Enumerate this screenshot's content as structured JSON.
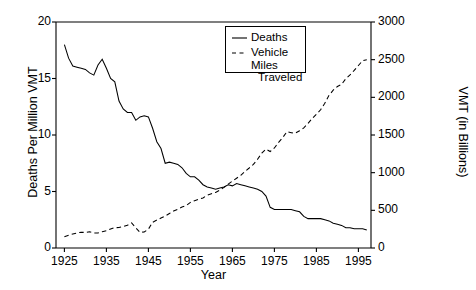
{
  "chart_data": {
    "type": "line",
    "title": "",
    "xlabel": "Year",
    "ylabel": "Deaths Per Million VMT",
    "ylabel_right": "VMT (in Billions)",
    "xlim": [
      1923,
      1998
    ],
    "ylim": [
      0,
      20
    ],
    "ylim_right": [
      0,
      3000
    ],
    "grid": false,
    "legend_position": "top-center",
    "xticks": [
      1925,
      1935,
      1945,
      1955,
      1965,
      1975,
      1985,
      1995
    ],
    "xtick_labels": [
      "1925",
      "1935",
      "1945",
      "1955",
      "1965",
      "1975",
      "1985",
      "1995"
    ],
    "yticks_left": [
      0,
      5,
      10,
      15,
      20
    ],
    "ytick_labels_left": [
      "0",
      "5",
      "10",
      "15",
      "20"
    ],
    "yticks_right": [
      0,
      500,
      1000,
      1500,
      2000,
      2500,
      3000
    ],
    "ytick_labels_right": [
      "0",
      "500",
      "1000",
      "1500",
      "2000",
      "2500",
      "3000"
    ],
    "x": [
      1925,
      1926,
      1927,
      1928,
      1929,
      1930,
      1931,
      1932,
      1933,
      1934,
      1935,
      1936,
      1937,
      1938,
      1939,
      1940,
      1941,
      1942,
      1943,
      1944,
      1945,
      1946,
      1947,
      1948,
      1949,
      1950,
      1951,
      1952,
      1953,
      1954,
      1955,
      1956,
      1957,
      1958,
      1959,
      1960,
      1961,
      1962,
      1963,
      1964,
      1965,
      1966,
      1967,
      1968,
      1969,
      1970,
      1971,
      1972,
      1973,
      1974,
      1975,
      1976,
      1977,
      1978,
      1979,
      1980,
      1981,
      1982,
      1983,
      1984,
      1985,
      1986,
      1987,
      1988,
      1989,
      1990,
      1991,
      1992,
      1993,
      1994,
      1995,
      1996,
      1997
    ],
    "series": [
      {
        "name": "Deaths",
        "axis": "left",
        "style": "solid",
        "units": "deaths per million VMT",
        "values": [
          18.0,
          16.8,
          16.1,
          16.0,
          15.9,
          15.8,
          15.5,
          15.3,
          16.2,
          16.7,
          15.9,
          15.0,
          14.7,
          13.0,
          12.3,
          12.0,
          12.0,
          11.3,
          11.6,
          11.7,
          11.6,
          10.6,
          9.4,
          8.8,
          7.5,
          7.6,
          7.5,
          7.4,
          7.1,
          6.6,
          6.3,
          6.3,
          6.0,
          5.6,
          5.4,
          5.3,
          5.2,
          5.3,
          5.4,
          5.6,
          5.5,
          5.7,
          5.6,
          5.5,
          5.4,
          5.3,
          5.2,
          5.0,
          4.6,
          3.6,
          3.4,
          3.4,
          3.4,
          3.4,
          3.4,
          3.3,
          3.2,
          2.8,
          2.6,
          2.6,
          2.6,
          2.6,
          2.5,
          2.4,
          2.2,
          2.1,
          2.0,
          1.8,
          1.8,
          1.7,
          1.7,
          1.7,
          1.6
        ]
      },
      {
        "name": "Vehicle Miles Traveled",
        "axis": "right",
        "style": "dashed",
        "units": "billions of vehicle miles",
        "values": [
          150,
          170,
          185,
          198,
          210,
          206,
          216,
          200,
          201,
          216,
          229,
          252,
          270,
          271,
          285,
          302,
          334,
          268,
          208,
          213,
          250,
          341,
          371,
          398,
          424,
          458,
          491,
          514,
          544,
          562,
          605,
          628,
          647,
          665,
          700,
          719,
          738,
          767,
          805,
          847,
          888,
          926,
          965,
          1016,
          1062,
          1110,
          1179,
          1260,
          1313,
          1281,
          1328,
          1402,
          1467,
          1545,
          1529,
          1527,
          1556,
          1595,
          1653,
          1720,
          1775,
          1835,
          1921,
          2026,
          2096,
          2144,
          2172,
          2247,
          2297,
          2358,
          2423,
          2486,
          2500
        ]
      }
    ]
  },
  "legend": {
    "items": [
      {
        "label": "Deaths",
        "label_line2": ""
      },
      {
        "label": "Vehicle Miles",
        "label_line2": "Traveled"
      }
    ]
  }
}
